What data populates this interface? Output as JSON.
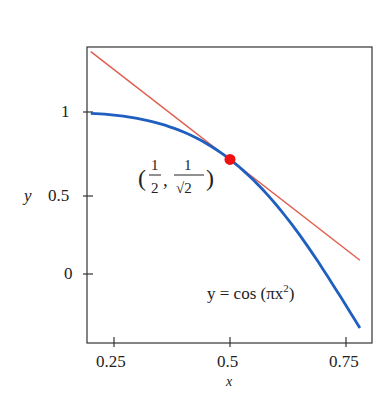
{
  "chart_data": {
    "type": "line",
    "title": "",
    "xlabel": "x",
    "ylabel": "y",
    "xlim": [
      0.2,
      0.8
    ],
    "ylim": [
      -0.42,
      1.4
    ],
    "x_ticks": [
      "0.25",
      "0.5",
      "0.75"
    ],
    "y_ticks": [
      "0",
      "0.5",
      "1"
    ],
    "grid": false,
    "series": [
      {
        "name": "y = cos(πx²)",
        "color": "#1f5fbf",
        "x": [
          0.2,
          0.3,
          0.4,
          0.5,
          0.6,
          0.7,
          0.78
        ],
        "y": [
          0.992,
          0.96,
          0.876,
          0.707,
          0.432,
          0.047,
          -0.334
        ]
      },
      {
        "name": "tangent line",
        "color": "#e06050",
        "x": [
          0.2,
          0.78
        ],
        "y": [
          1.373,
          0.085
        ]
      }
    ],
    "point": {
      "x": 0.5,
      "y": 0.7071,
      "label": "(1/2, 1/√2)",
      "color": "#ee1111"
    },
    "annotation": "y = cos(πx²)"
  },
  "labels": {
    "xlabel": "x",
    "ylabel": "y",
    "yt0": "0",
    "yt05": "0.5",
    "yt1": "1",
    "xt025": "0.25",
    "xt05": "0.5",
    "xt075": "0.75",
    "curve_text": "y = cos (πx",
    "sup": "2",
    "close": ")"
  }
}
